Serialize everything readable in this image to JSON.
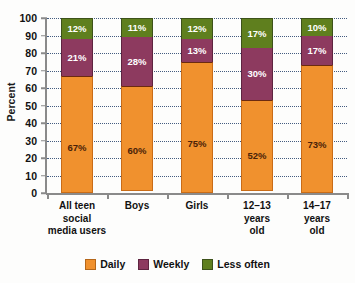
{
  "chart_data": {
    "type": "bar",
    "subtype": "stacked-bar-100",
    "title": "",
    "xlabel": "",
    "ylabel": "Percent",
    "ylim": [
      0,
      100
    ],
    "ytick_step": 10,
    "yticks": [
      0,
      10,
      20,
      30,
      40,
      50,
      60,
      70,
      80,
      90,
      100
    ],
    "grid": true,
    "grid_style": "dotted-horizontal",
    "legend_position": "bottom",
    "categories": [
      "All teen\nsocial\nmedia users",
      "Boys",
      "Girls",
      "12–13\nyears\nold",
      "14–17\nyears\nold"
    ],
    "category_lines": [
      [
        "All teen",
        "social",
        "media users"
      ],
      [
        "Boys"
      ],
      [
        "Girls"
      ],
      [
        "12–13",
        "years",
        "old"
      ],
      [
        "14–17",
        "years",
        "old"
      ]
    ],
    "series": [
      {
        "name": "Daily",
        "color": "#f0912e",
        "values": [
          67,
          60,
          75,
          52,
          73
        ],
        "labels": [
          "67%",
          "60%",
          "75%",
          "52%",
          "73%"
        ]
      },
      {
        "name": "Weekly",
        "color": "#8d3a5f",
        "values": [
          21,
          28,
          13,
          30,
          17
        ],
        "labels": [
          "21%",
          "28%",
          "13%",
          "30%",
          "17%"
        ]
      },
      {
        "name": "Less often",
        "color": "#5f7f1e",
        "values": [
          12,
          11,
          12,
          17,
          10
        ],
        "labels": [
          "12%",
          "11%",
          "12%",
          "17%",
          "10%"
        ]
      }
    ],
    "legend": [
      {
        "label": "Daily",
        "color": "#f0912e",
        "swatch": "daily-swatch"
      },
      {
        "label": "Weekly",
        "color": "#8d3a5f",
        "swatch": "weekly-swatch"
      },
      {
        "label": "Less often",
        "color": "#5f7f1e",
        "swatch": "less-often-swatch"
      }
    ],
    "axis_color": "#8a8a8a",
    "gridline_color": "#24406b",
    "background": "#fdfdfc"
  }
}
